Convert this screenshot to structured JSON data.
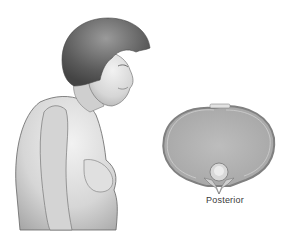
{
  "illustration": {
    "subject": "elderly woman in side profile with forward-curved upper back",
    "cross_section_label": "Posterior",
    "colors": {
      "skin": "#d9d9d9",
      "hair": "#6a6a6a",
      "outline": "#555555",
      "section_fill": "#b4b4b4",
      "section_rim": "#9a9a9a",
      "label": "#3a3a3a"
    }
  }
}
